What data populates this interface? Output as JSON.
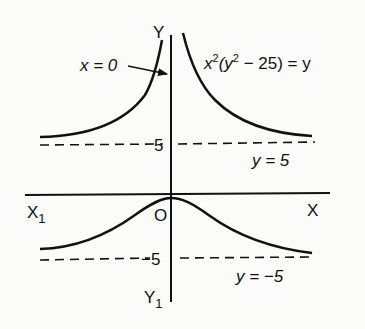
{
  "diagram": {
    "type": "curve-sketch",
    "equation": "x²(y² − 25) = y",
    "equation_parts": {
      "x": "x",
      "sup1": "2",
      "open": "(y",
      "sup2": "2",
      "rest": " − 25) = y"
    },
    "axes": {
      "y_label": "Y",
      "y_neg_label": "Y",
      "y_neg_sub": "1",
      "x_label": "X",
      "x_neg_label": "X",
      "x_neg_sub": "1",
      "origin_label": "O"
    },
    "ticks": {
      "pos5": "5",
      "neg5": "−5"
    },
    "asymptotes": [
      {
        "label": "y = 5",
        "value": 5,
        "style": "dashed"
      },
      {
        "label": "y = −5",
        "value": -5,
        "style": "dashed"
      }
    ],
    "annotation": {
      "text": "x = 0",
      "points_to": "y-axis (vertical asymptote)"
    },
    "colors": {
      "ink": "#111111",
      "paper": "#fbfbfa"
    }
  }
}
